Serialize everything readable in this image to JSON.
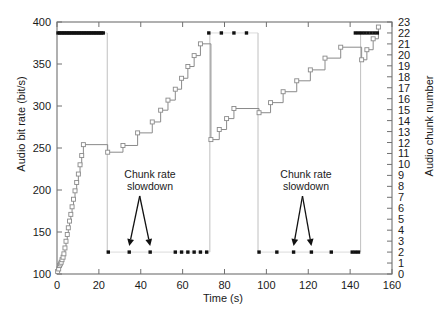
{
  "chart_data": {
    "type": "line",
    "title": "",
    "xlabel": "Time (s)",
    "ylabel": "Audio bit rate (bit/s)",
    "y2label": "Audio chunk number",
    "xlim": [
      0,
      160
    ],
    "ylim": [
      100,
      400
    ],
    "y2lim": [
      0,
      23
    ],
    "xticks": [
      0,
      20,
      40,
      60,
      80,
      100,
      120,
      140,
      160
    ],
    "yticks": [
      100,
      150,
      200,
      250,
      300,
      350,
      400
    ],
    "y2ticks": [
      0,
      1,
      2,
      3,
      4,
      5,
      6,
      7,
      8,
      9,
      10,
      11,
      12,
      13,
      14,
      15,
      16,
      17,
      18,
      19,
      20,
      21,
      22,
      23
    ],
    "grid": false,
    "legend_position": "none",
    "series": [
      {
        "name": "Audio bit rate",
        "axis": "left",
        "type": "step",
        "color": "#8a8a8a",
        "marker": "open-square",
        "points": [
          [
            0.3,
            103
          ],
          [
            0.8,
            106
          ],
          [
            1.2,
            110
          ],
          [
            1.6,
            112
          ],
          [
            2.0,
            114
          ],
          [
            2.4,
            117
          ],
          [
            2.9,
            120
          ],
          [
            3.3,
            124
          ],
          [
            3.8,
            131
          ],
          [
            4.3,
            139
          ],
          [
            4.9,
            147
          ],
          [
            5.4,
            155
          ],
          [
            6.0,
            163
          ],
          [
            6.6,
            171
          ],
          [
            7.2,
            180
          ],
          [
            7.9,
            189
          ],
          [
            8.6,
            199
          ],
          [
            9.4,
            209
          ],
          [
            10.2,
            219
          ],
          [
            11.0,
            230
          ],
          [
            11.8,
            241
          ],
          [
            12.6,
            254
          ],
          [
            24.2,
            245
          ],
          [
            31.5,
            253
          ],
          [
            38.5,
            268
          ],
          [
            45.5,
            281
          ],
          [
            49.5,
            295
          ],
          [
            53.0,
            307
          ],
          [
            56.5,
            320
          ],
          [
            59.5,
            333
          ],
          [
            62.5,
            347
          ],
          [
            65.5,
            360
          ],
          [
            68.5,
            374
          ],
          [
            73.5,
            260
          ],
          [
            77.5,
            272
          ],
          [
            81.0,
            285
          ],
          [
            84.5,
            297
          ],
          [
            96.5,
            292
          ],
          [
            102.0,
            304
          ],
          [
            108.0,
            317
          ],
          [
            114.5,
            330
          ],
          [
            121.0,
            343
          ],
          [
            128.0,
            357
          ],
          [
            135.5,
            370
          ],
          [
            145.5,
            355
          ],
          [
            148.0,
            367
          ],
          [
            151.0,
            380
          ],
          [
            153.5,
            394
          ]
        ]
      },
      {
        "name": "Audio chunk number (buffer)",
        "axis": "right",
        "type": "scatter",
        "color": "#111111",
        "marker": "filled-square",
        "high_level_value": 22,
        "low_level_value": 2,
        "points_high_x": [
          0.5,
          1.3,
          2.1,
          2.9,
          3.7,
          4.5,
          5.3,
          6.1,
          6.9,
          7.7,
          8.5,
          9.3,
          10.1,
          10.9,
          11.7,
          12.5,
          13.3,
          14.1,
          14.9,
          15.7,
          16.5,
          17.3,
          18.1,
          18.9,
          19.7,
          20.5,
          21.3,
          22.1,
          72.5,
          78.5,
          84.5,
          90.5,
          142.5,
          144.0,
          145.5,
          147.0,
          148.5,
          150.0,
          151.5,
          153.0
        ],
        "points_low_x": [
          24.5,
          34.5,
          44.5,
          56.5,
          59.5,
          62.5,
          65.5,
          68.5,
          71.5,
          96.5,
          105.0,
          113.0,
          121.5,
          131.0,
          141.0,
          142.5,
          144.0
        ]
      }
    ],
    "drop_lines_x": [
      24.0,
      73.0,
      96.0,
      145.0
    ],
    "annotations": [
      {
        "text_line1": "Chunk rate",
        "text_line2": "slowdown",
        "tip_x": [
          34.5,
          44.5
        ],
        "tip_y": 2
      },
      {
        "text_line1": "Chunk rate",
        "text_line2": "slowdown",
        "tip_x": [
          113.0,
          121.5
        ],
        "tip_y": 2
      }
    ]
  },
  "axes": {
    "x_label": "Time (s)",
    "y_left_label": "Audio bit rate (bit/s)",
    "y_right_label": "Audio chunk number"
  },
  "annotation_text": {
    "line1": "Chunk rate",
    "line2": "slowdown"
  }
}
